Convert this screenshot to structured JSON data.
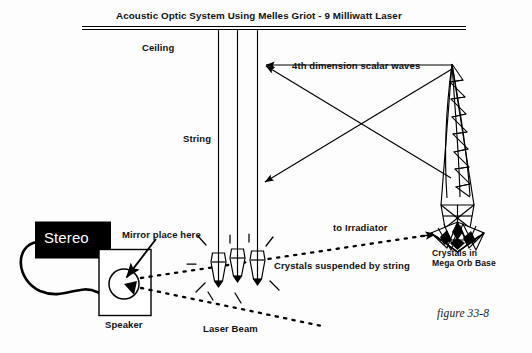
{
  "figure": {
    "title": "Acoustic Optic System Using Melles Griot - 9 Milliwatt  Laser",
    "caption": "figure 33-8",
    "ink_color": "#000000",
    "background_color": "#fdfdfd"
  },
  "labels": {
    "ceiling": "Ceiling",
    "string": "String",
    "scalar_waves": "4th dimension scalar waves",
    "mirror": "Mirror place here",
    "to_irradiator": "to Irradiator",
    "crystals_suspended": "Crystals suspended by string",
    "laser_beam": "Laser Beam",
    "speaker": "Speaker",
    "stereo": "Stereo",
    "orb_base_line1": "Crystals in",
    "orb_base_line2": "Mega Orb Base"
  },
  "components": {
    "stereo_box": {
      "fill": "#000000",
      "text_color": "#ffffff"
    },
    "speaker_box": {
      "fill": "#ffffff",
      "stroke": "#000000"
    },
    "mirror": {
      "shape": "circle-with-wedge"
    },
    "strings": {
      "count": 3
    },
    "crystals_suspended": {
      "count": 3
    },
    "scalar_wave_arrows": {
      "count": 2,
      "style": "crossed-double-arrow"
    },
    "laser_beams": {
      "count": 2,
      "style": "dotted"
    },
    "mega_orb": {
      "structure": "curved-lattice-mast",
      "base": "crystal-cluster"
    }
  }
}
